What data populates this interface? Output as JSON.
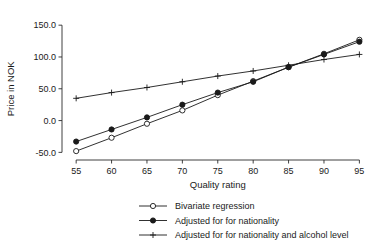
{
  "chart_data": {
    "type": "line",
    "title": "",
    "xlabel": "Quality rating",
    "ylabel": "Price in NOK",
    "x": [
      55,
      60,
      65,
      70,
      75,
      80,
      85,
      90,
      95
    ],
    "xlim": [
      53,
      96.5
    ],
    "ylim": [
      -62,
      155
    ],
    "xticks": [
      55,
      60,
      65,
      70,
      75,
      80,
      85,
      90,
      95
    ],
    "xtick_labels": [
      "55",
      "60",
      "65",
      "70",
      "75",
      "80",
      "85",
      "90",
      "95"
    ],
    "yticks": [
      -50,
      0,
      50,
      100,
      150
    ],
    "ytick_labels": [
      "-50.0",
      "0.0",
      "50.0",
      "100.0",
      "150.0"
    ],
    "grid": false,
    "legend_position": "below",
    "series": [
      {
        "name": "Bivariate regression",
        "marker": "open-circle",
        "values": [
          -48,
          -27,
          -5,
          16,
          40,
          62,
          84,
          105,
          127
        ]
      },
      {
        "name": "Adjusted for for nationality",
        "marker": "filled-circle",
        "values": [
          -33,
          -14,
          5,
          25,
          44,
          61,
          84,
          104,
          124
        ]
      },
      {
        "name": "Adjusted for for nationality and alcohol level",
        "marker": "plus",
        "values": [
          35,
          44,
          52,
          61,
          70,
          78,
          87,
          96,
          104
        ]
      }
    ]
  },
  "legend": {
    "items": [
      {
        "label": "Bivariate regression",
        "marker": "open-circle"
      },
      {
        "label": "Adjusted for for nationality",
        "marker": "filled-circle"
      },
      {
        "label": "Adjusted for for nationality and alcohol level",
        "marker": "plus"
      }
    ]
  },
  "colors": {
    "ink": "#1a1a1a",
    "axis": "#2b2b2b",
    "background": "#ffffff"
  }
}
